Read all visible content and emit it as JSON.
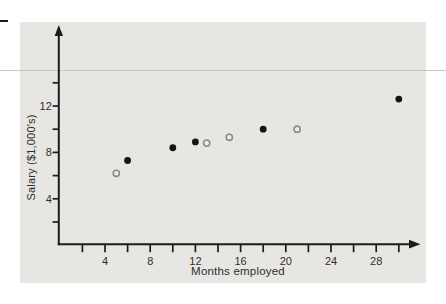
{
  "page": {
    "background": "#ffffff",
    "panel_color": "#e8e6e2",
    "rule_color": "#c9c7c4",
    "margin_dash_color": "#1a1a1a",
    "text_color": "#2e2e2e",
    "axis_color": "#1c1c1c"
  },
  "chart_data": {
    "type": "scatter",
    "title": "",
    "xlabel": "Months employed",
    "ylabel": "Salary ($1,000's)",
    "xlim": [
      0,
      31
    ],
    "ylim": [
      0,
      15.5
    ],
    "grid": false,
    "legend": "none",
    "x_ticks_labeled": [
      4,
      8,
      12,
      16,
      20,
      24,
      28
    ],
    "x_ticks_minor_range": [
      2,
      30
    ],
    "x_ticks_minor_step": 2,
    "y_ticks_labeled": [
      4,
      8,
      12
    ],
    "y_ticks_minor_range": [
      2,
      14
    ],
    "y_ticks_minor_step": 2,
    "series": [
      {
        "name": "filled-points",
        "marker": "filled-circle",
        "color": "#141414",
        "points": [
          [
            6,
            7.3
          ],
          [
            10,
            8.4
          ],
          [
            12,
            8.9
          ],
          [
            18,
            10.0
          ],
          [
            30,
            12.6
          ]
        ]
      },
      {
        "name": "open-points",
        "marker": "open-circle",
        "color": "#8a8a8a",
        "fill": "#efeeec",
        "points": [
          [
            5,
            6.2
          ],
          [
            13,
            8.8
          ],
          [
            15,
            9.3
          ],
          [
            21,
            10.0
          ]
        ]
      }
    ]
  }
}
